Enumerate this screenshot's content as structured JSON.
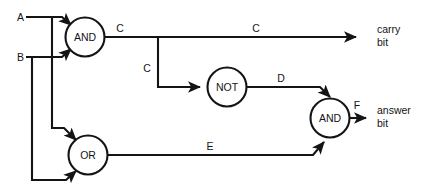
{
  "diagram": {
    "background_color": "#ffffff",
    "line_color": "#141414",
    "inputs": [
      {
        "id": "A",
        "label": "A"
      },
      {
        "id": "B",
        "label": "B"
      }
    ],
    "gates": [
      {
        "id": "and1",
        "label": "AND",
        "type": "AND"
      },
      {
        "id": "not1",
        "label": "NOT",
        "type": "NOT"
      },
      {
        "id": "or1",
        "label": "OR",
        "type": "OR"
      },
      {
        "id": "and2",
        "label": "AND",
        "type": "AND"
      }
    ],
    "signals": [
      {
        "id": "c_top",
        "label": "C"
      },
      {
        "id": "c_branch",
        "label": "C"
      },
      {
        "id": "d",
        "label": "D"
      },
      {
        "id": "e",
        "label": "E"
      },
      {
        "id": "f",
        "label": "F"
      }
    ],
    "outputs": [
      {
        "id": "carry",
        "line1": "carry",
        "line2": "bit"
      },
      {
        "id": "answer",
        "line1": "answer",
        "line2": "bit"
      }
    ]
  }
}
